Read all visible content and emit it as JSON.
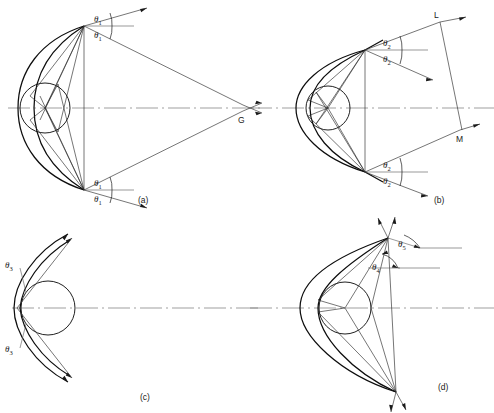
{
  "figure": {
    "type": "technical-line-diagram",
    "panel_count": 4
  },
  "panels": [
    {
      "id": "a",
      "caption": "(a)",
      "angle_labels": [
        "θ",
        "θ",
        "θ",
        "θ"
      ],
      "angle_symbol": "θ",
      "angle_subscript": "1",
      "point_labels": [
        "G"
      ],
      "point_label_g": "G"
    },
    {
      "id": "b",
      "caption": "(b)",
      "angle_symbol": "θ",
      "angle_subscript": "2",
      "point_labels": [
        "L",
        "M"
      ],
      "point_label_l": "L",
      "point_label_m": "M"
    },
    {
      "id": "c",
      "caption": "(c)",
      "angle_symbol": "θ",
      "angle_subscript": "3",
      "point_labels": []
    },
    {
      "id": "d",
      "caption": "(d)",
      "angle_symbol": "θ",
      "angle_subscript_upper": "5",
      "angle_subscript_lower": "4",
      "point_labels": []
    }
  ],
  "colors": {
    "background": "#ffffff",
    "reflector_stroke": "#0d0d0d",
    "ray_stroke": "#2b2b2b",
    "axis_stroke": "#777777",
    "text": "#1a1a1a"
  }
}
